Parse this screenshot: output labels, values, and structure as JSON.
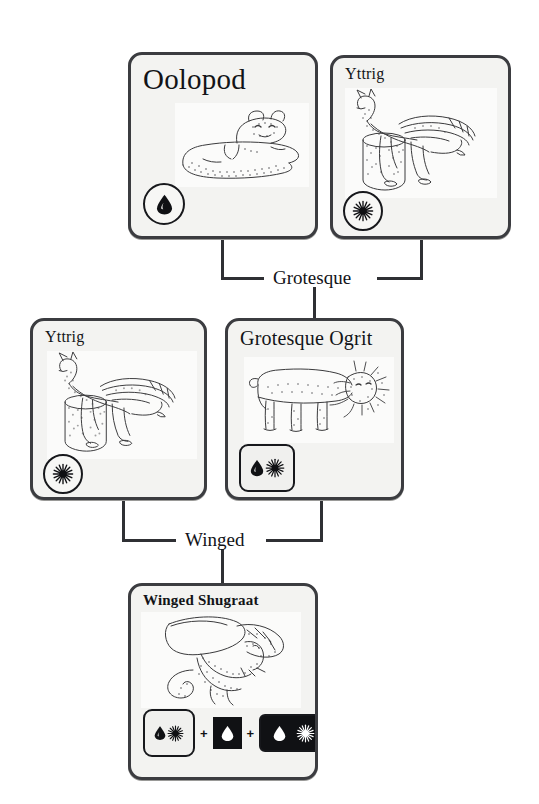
{
  "diagram": {
    "type": "breeding-lineage-tree",
    "generations": 3
  },
  "cards": {
    "oolopod": {
      "title": "Oolopod",
      "creature": "oolopod-sketch",
      "traits": [
        "water-drop"
      ],
      "badge_shape": "circle"
    },
    "yttrig_top": {
      "title": "Yttrig",
      "creature": "yttrig-sketch",
      "traits": [
        "starburst"
      ],
      "badge_shape": "circle"
    },
    "yttrig_mid": {
      "title": "Yttrig",
      "creature": "yttrig-sketch",
      "traits": [
        "starburst"
      ],
      "badge_shape": "circle"
    },
    "grotesque_ogrit": {
      "title": "Grotesque Ogrit",
      "creature": "ogrit-sketch",
      "traits": [
        "water-drop",
        "starburst"
      ],
      "badge_shape": "rounded-square"
    },
    "winged_shugraat": {
      "title": "Winged Shugraat",
      "creature": "shugraat-sketch",
      "traits": [
        "water-drop",
        "starburst"
      ],
      "badge_shape": "rounded-square",
      "formula": {
        "operator_1": "+",
        "operator_2": "+",
        "term_1": {
          "style": "light-rounded",
          "glyphs": [
            "water-drop",
            "starburst"
          ]
        },
        "term_2": {
          "style": "dark-square",
          "glyphs": [
            "water-drop"
          ]
        },
        "term_3": {
          "style": "dark-rounded",
          "glyphs": [
            "water-drop",
            "starburst"
          ]
        }
      }
    }
  },
  "edges": {
    "grotesque": {
      "label": "Grotesque"
    },
    "winged": {
      "label": "Winged"
    }
  },
  "colors": {
    "card_border": "#3b3c40",
    "card_fill": "#f3f3f1",
    "art_fill": "#fbfbfa",
    "ink": "#121317",
    "connector": "#2f3034",
    "chip_dark": "#101114",
    "page": "#ffffff"
  }
}
